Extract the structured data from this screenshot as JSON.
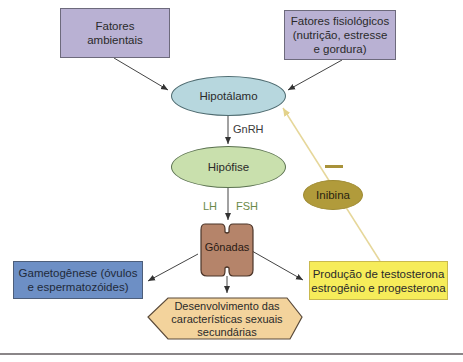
{
  "nodes": {
    "fatores_ambientais": {
      "line1": "Fatores",
      "line2": "ambientais"
    },
    "fatores_fisiologicos": {
      "line1": "Fatores fisiológicos",
      "line2": "(nutrição, estresse",
      "line3": "e gordura)"
    },
    "hipotalamo": {
      "label": "Hipotálamo"
    },
    "hipofise": {
      "label": "Hipófise"
    },
    "gonadas": {
      "label": "Gônadas"
    },
    "inibina": {
      "label": "Inibina"
    },
    "gametogenese": {
      "line1": "Gametogênese (óvulos",
      "line2": "e espermatozóides)"
    },
    "producao": {
      "line1": "Produção de testosterona",
      "line2": "estrogênio e progesterona"
    },
    "desenvolvimento": {
      "line1": "Desenvolvimento das",
      "line2": "características sexuais",
      "line3": "secundárias"
    }
  },
  "edge_labels": {
    "gnrh": "GnRH",
    "lh": "LH",
    "fsh": "FSH",
    "inhibition": "—"
  },
  "colors": {
    "purple_box": "#b9b1d3",
    "blue_box": "#6d8fc5",
    "yellow_box": "#f6ec5a",
    "hipotalamo": "#b7d7de",
    "hipofise": "#c9e0ad",
    "inibina": "#b19b3b",
    "gonadas": "#b5846a",
    "desenvolvimento": "#f3d39c",
    "feedback_line": "#e6d79a",
    "hormone_label": "#6a8a48"
  }
}
